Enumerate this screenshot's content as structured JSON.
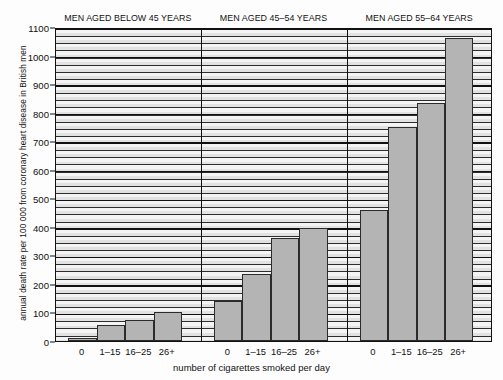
{
  "chart_data": {
    "type": "bar",
    "title": "",
    "xlabel": "number of cigarettes smoked per day",
    "ylabel": "annual death rate per 100 000 from coronary heart disease in British men",
    "ylim": [
      0,
      1100
    ],
    "ytick_labels": [
      "0",
      "100",
      "200",
      "300",
      "400",
      "500",
      "600",
      "700",
      "800",
      "900",
      "1000",
      "1100"
    ],
    "ytick_values": [
      0,
      100,
      200,
      300,
      400,
      500,
      600,
      700,
      800,
      900,
      1000,
      1100
    ],
    "grid": true,
    "legend": "none",
    "categories": [
      "0",
      "1–15",
      "16–25",
      "26+"
    ],
    "panels": [
      {
        "title": "MEN AGED BELOW 45 YEARS",
        "categories": [
          "0",
          "1–15",
          "16–25",
          "26+"
        ],
        "values": [
          10,
          55,
          75,
          102
        ]
      },
      {
        "title": "MEN AGED 45–54 YEARS",
        "categories": [
          "0",
          "1–15",
          "16–25",
          "26+"
        ],
        "values": [
          140,
          235,
          360,
          397
        ]
      },
      {
        "title": "MEN AGED 55–64 YEARS",
        "categories": [
          "0",
          "1–15",
          "16–25",
          "26+"
        ],
        "values": [
          460,
          750,
          835,
          1060
        ]
      }
    ],
    "bar_color": "#b4b4b4",
    "bar_edge_color": "#2b2b2b",
    "plot_background": "#efefef",
    "axis_color": "#111111"
  }
}
